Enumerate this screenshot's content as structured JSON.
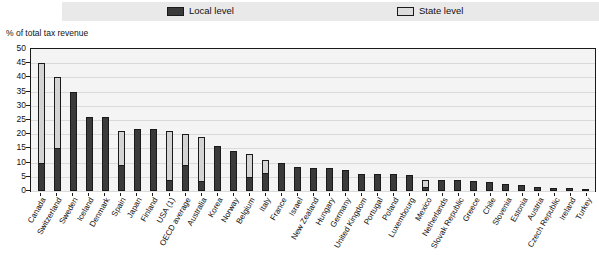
{
  "legend": {
    "items": [
      {
        "label": "Local level",
        "color": "#3a3a3a",
        "icon": "local-swatch"
      },
      {
        "label": "State level",
        "color": "#d4d4d4",
        "icon": "state-swatch"
      }
    ]
  },
  "axis_title": "% of total tax revenue",
  "chart_data": {
    "type": "bar",
    "title": "",
    "subtitle": "",
    "xlabel": "",
    "ylabel": "% of total tax revenue",
    "ylim": [
      0,
      50
    ],
    "yticks": [
      0,
      5,
      10,
      15,
      20,
      25,
      30,
      35,
      40,
      45,
      50
    ],
    "grid": true,
    "stacked": true,
    "legend_position": "top",
    "categories": [
      "Canada",
      "Switzerland",
      "Sweden",
      "Iceland",
      "Denmark",
      "Spain",
      "Japan",
      "Finland",
      "USA (1)",
      "OECD average",
      "Australia",
      "Korea",
      "Norway",
      "Belgium",
      "Italy",
      "France",
      "Israel",
      "New Zealand",
      "Hungary",
      "Germany",
      "United Kingdom",
      "Portugal",
      "Poland",
      "Luxembourg",
      "Mexico",
      "Netherlands",
      "Slovak Republic",
      "Greece",
      "Chile",
      "Slovenia",
      "Estonia",
      "Austria",
      "Czech Republic",
      "Ireland",
      "Turkey"
    ],
    "series": [
      {
        "name": "Local level",
        "color": "#3a3a3a",
        "values": [
          10,
          15,
          35,
          26,
          26,
          9,
          22,
          22,
          4,
          9,
          3.5,
          16,
          14,
          5,
          6.5,
          10,
          8.5,
          8,
          8,
          7.5,
          6,
          6,
          6,
          5.5,
          1.5,
          4,
          4,
          3.5,
          3,
          2.5,
          2,
          1.5,
          1.2,
          1,
          0.8
        ]
      },
      {
        "name": "State level",
        "color": "#d4d4d4",
        "values": [
          35,
          25,
          0,
          0,
          0,
          12,
          0,
          0,
          17,
          11,
          15.5,
          0,
          0,
          8,
          4.5,
          0,
          0,
          0,
          0,
          0,
          0,
          0,
          0,
          0,
          2.5,
          0,
          0,
          0,
          0,
          0,
          0,
          0,
          0,
          0,
          0
        ]
      }
    ],
    "totals": [
      45,
      40,
      35,
      26,
      26,
      21,
      22,
      22,
      21,
      20,
      19,
      16,
      14,
      13,
      11,
      10,
      8.5,
      8,
      8,
      7.5,
      6,
      6,
      6,
      5.5,
      4,
      4,
      4,
      3.5,
      3,
      2.5,
      2,
      1.5,
      1.2,
      1,
      0.8
    ]
  }
}
